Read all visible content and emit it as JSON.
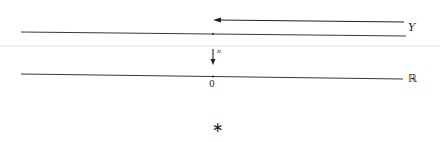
{
  "diagram": {
    "top_line": {
      "label": "Y",
      "x1": 21,
      "y1": 32,
      "x2": 406,
      "y2": 36
    },
    "top_arrow": {
      "direction": "left",
      "x1": 404,
      "y1": 22,
      "x2": 213,
      "y2": 20
    },
    "divider": {
      "y": 46,
      "color": "#e3e3e3"
    },
    "projection_arrow": {
      "label": "π",
      "direction": "down",
      "x": 213,
      "y1": 49,
      "y2": 64
    },
    "bottom_line": {
      "label": "ℝ",
      "x1": 21,
      "y1": 74,
      "x2": 403,
      "y2": 79
    },
    "origin": {
      "label": "0",
      "x": 213
    },
    "marker": {
      "symbol": "∗"
    },
    "colors": {
      "line": "#222222",
      "divider": "#e3e3e3",
      "background": "#ffffff"
    }
  }
}
